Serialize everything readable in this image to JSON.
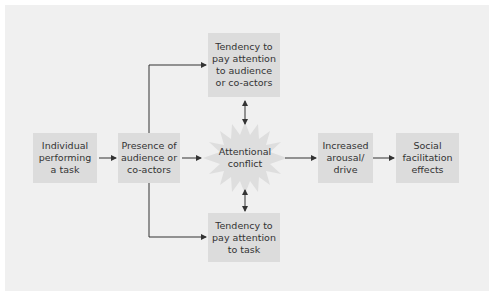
{
  "diagram": {
    "type": "flowchart",
    "nodes": {
      "individual": {
        "lines": [
          "Individual",
          "performing",
          "a task"
        ]
      },
      "presence": {
        "lines": [
          "Presence of",
          "audience or",
          "co-actors"
        ]
      },
      "attend_audience": {
        "lines": [
          "Tendency to",
          "pay attention",
          "to audience",
          "or co-actors"
        ]
      },
      "conflict": {
        "lines": [
          "Attentional",
          "conflict"
        ]
      },
      "attend_task": {
        "lines": [
          "Tendency to",
          "pay attention",
          "to task"
        ]
      },
      "arousal": {
        "lines": [
          "Increased",
          "arousal/",
          "drive"
        ]
      },
      "effects": {
        "lines": [
          "Social",
          "facilitation",
          "effects"
        ]
      }
    },
    "edges": [
      {
        "from": "individual",
        "to": "presence",
        "type": "arrow"
      },
      {
        "from": "presence",
        "to": "attend_audience",
        "type": "elbow-arrow"
      },
      {
        "from": "presence",
        "to": "attend_task",
        "type": "elbow-arrow"
      },
      {
        "from": "presence",
        "to": "conflict",
        "type": "arrow"
      },
      {
        "from": "attend_audience",
        "to": "conflict",
        "type": "double-arrow"
      },
      {
        "from": "attend_task",
        "to": "conflict",
        "type": "double-arrow"
      },
      {
        "from": "conflict",
        "to": "arousal",
        "type": "arrow"
      },
      {
        "from": "arousal",
        "to": "effects",
        "type": "arrow"
      }
    ],
    "colors": {
      "panel": "#f0f0f0",
      "box": "#dcdcdc",
      "burst": "#dedede",
      "line": "#333333",
      "text": "#333333"
    }
  }
}
